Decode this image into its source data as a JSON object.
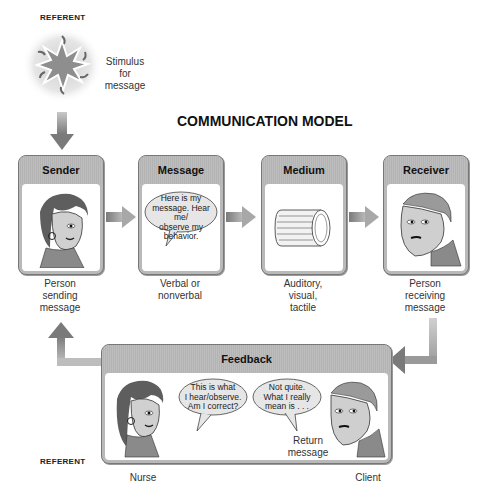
{
  "diagram": {
    "title": "COMMUNICATION MODEL",
    "referent_top": "REFERENT",
    "referent_bottom": "REFERENT",
    "stimulus": {
      "lines": [
        "Stimulus",
        "for",
        "message"
      ]
    },
    "stages": [
      {
        "id": "sender",
        "header": "Sender",
        "caption_lines": [
          "Person",
          "sending",
          "message"
        ],
        "icon": "woman-face-icon"
      },
      {
        "id": "message",
        "header": "Message",
        "caption_lines": [
          "Verbal or",
          "nonverbal"
        ],
        "bubble_lines": [
          "Here is my",
          "message. Hear me/",
          "observe my",
          "behavior."
        ],
        "icon": "speech-bubble-icon"
      },
      {
        "id": "medium",
        "header": "Medium",
        "caption_lines": [
          "Auditory,",
          "visual,",
          "tactile"
        ],
        "icon": "cylinder-icon"
      },
      {
        "id": "receiver",
        "header": "Receiver",
        "caption_lines": [
          "Person",
          "receiving",
          "message"
        ],
        "icon": "man-face-icon"
      }
    ],
    "feedback": {
      "header": "Feedback",
      "nurse_bubble_lines": [
        "This is what",
        "I hear/observe.",
        "Am I correct?"
      ],
      "client_bubble_lines": [
        "Not quite.",
        "What I really",
        "mean is . . ."
      ],
      "return_lines": [
        "Return",
        "message"
      ],
      "nurse_label": "Nurse",
      "client_label": "Client"
    },
    "colors": {
      "box_header": "#b9b9b9",
      "box_border": "#777777",
      "arrow": "#8c8c8c",
      "bubble_fill": "#e6e6e6"
    }
  }
}
